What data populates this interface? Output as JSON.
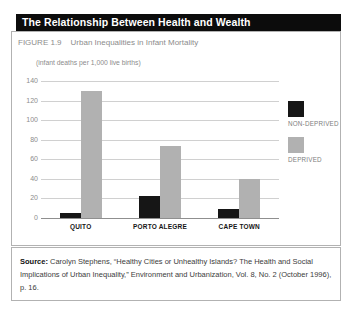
{
  "header": {
    "title": "The Relationship Between Health and Wealth"
  },
  "figure": {
    "label": "FIGURE 1.9",
    "caption": "Urban Inequalities in Infant Mortality"
  },
  "chart_data": {
    "type": "bar",
    "title": "Urban Inequalities in Infant Mortality",
    "units_label": "(infant deaths per 1,000 live births)",
    "categories": [
      "QUITO",
      "PORTO ALEGRE",
      "CAPE TOWN"
    ],
    "series": [
      {
        "name": "NON-DEPRIVED",
        "color": "#161616",
        "values": [
          5,
          23,
          9
        ]
      },
      {
        "name": "DEPRIVED",
        "color": "#b1b1b1",
        "values": [
          130,
          74,
          40
        ]
      }
    ],
    "ylabel": "infant deaths per 1,000 live births",
    "ylim": [
      0,
      140
    ],
    "yticks": [
      0,
      20,
      40,
      60,
      80,
      100,
      120,
      140
    ],
    "grid": true,
    "legend_position": "right"
  },
  "source": {
    "label": "Source:",
    "lines": [
      "Carolyn Stephens, “Healthy Cities or Unhealthy Islands?  The Health and Social",
      "Implications of Urban Inequality,” Environment and Urbanization, Vol. 8, No. 2 (October 1996),",
      "p. 16."
    ]
  }
}
